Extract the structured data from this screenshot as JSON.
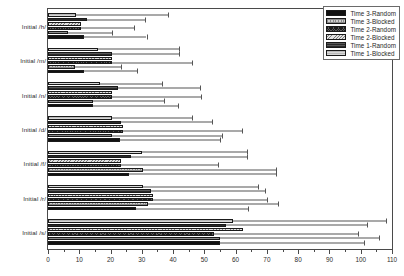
{
  "chart_data": {
    "type": "bar",
    "orientation": "horizontal",
    "title": "",
    "xlabel": "",
    "ylabel": "",
    "xlim": [
      0,
      110
    ],
    "xticks": [
      0,
      10,
      20,
      30,
      40,
      50,
      60,
      70,
      80,
      90,
      100,
      110
    ],
    "grid": false,
    "legend_position": "top-right",
    "categories": [
      "Initial /h/",
      "Initial /m/",
      "Initial /n/",
      "Initial /d/",
      "Initial /f/",
      "Initial /r/",
      "Initial /s/"
    ],
    "series": [
      {
        "name": "Time 1-Blocked",
        "fill": "light-gray-solid",
        "values": [
          9.0,
          16.0,
          16.5,
          20.5,
          30.0,
          30.5,
          59.0
        ],
        "errors": [
          29.5,
          26.0,
          20.0,
          25.5,
          33.5,
          36.5,
          49.0
        ]
      },
      {
        "name": "Time 1-Random",
        "fill": "dark-gray-horizontal-lines",
        "values": [
          12.5,
          20.5,
          22.5,
          23.5,
          26.5,
          33.0,
          57.0
        ],
        "errors": [
          18.5,
          21.5,
          26.0,
          29.0,
          37.0,
          36.5,
          45.0
        ]
      },
      {
        "name": "Time 2-Blocked",
        "fill": "light-diagonal-hatch",
        "values": [
          10.5,
          20.5,
          20.5,
          24.0,
          23.5,
          33.5,
          62.5
        ]
      },
      {
        "name": "Time 2-Random",
        "fill": "dark-crosshatch",
        "values": [
          10.5,
          20.5,
          20.5,
          24.0,
          23.5,
          33.5,
          53.0
        ],
        "errors": [
          17.0,
          25.5,
          28.5,
          38.0,
          31.0,
          36.5,
          46.0
        ]
      },
      {
        "name": "Time 3-Blocked",
        "fill": "light-dotted",
        "values": [
          6.5,
          8.5,
          14.5,
          20.5,
          30.5,
          32.0,
          55.0
        ],
        "errors": [
          14.0,
          15.0,
          22.5,
          35.0,
          42.5,
          41.5,
          51.0
        ]
      },
      {
        "name": "Time 3-Random",
        "fill": "black-solid",
        "values": [
          11.5,
          11.5,
          14.5,
          23.0,
          26.0,
          28.0,
          55.0
        ],
        "errors": [
          20.0,
          17.0,
          27.0,
          32.0,
          47.0,
          36.0,
          46.0
        ]
      }
    ]
  },
  "legend": {
    "items": [
      {
        "label": "Time 3-Random",
        "swatch": "black-solid"
      },
      {
        "label": "Time 3-Blocked",
        "swatch": "light-dotted"
      },
      {
        "label": "Time 2-Random",
        "swatch": "dark-crosshatch"
      },
      {
        "label": "Time 2-Blocked",
        "swatch": "light-diagonal-hatch"
      },
      {
        "label": "Time 1-Random",
        "swatch": "dark-gray-horizontal-lines"
      },
      {
        "label": "Time 1-Blocked",
        "swatch": "light-gray-solid"
      }
    ]
  },
  "axis": {
    "x_tick_labels": [
      "0",
      "10",
      "20",
      "30",
      "40",
      "50",
      "60",
      "70",
      "80",
      "90",
      "100",
      "110"
    ],
    "y_tick_labels": [
      "Initial /h/",
      "Initial /m/",
      "Initial /n/",
      "Initial /d/",
      "Initial /f/",
      "Initial /r/",
      "Initial /s/"
    ]
  },
  "colors": {
    "frame": "#4a4a4a",
    "text": "#2b2b2b",
    "bar_dark": "#111111",
    "bar_mid": "#5a5a5a",
    "bar_light": "#cfcfcf",
    "error_bar": "#555555"
  }
}
